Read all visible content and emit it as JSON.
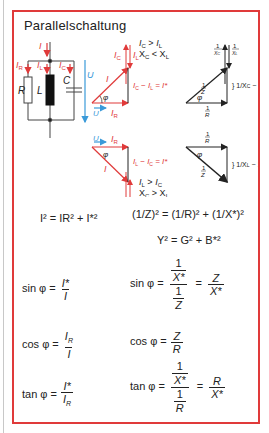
{
  "title": "Parallelschaltung",
  "colors": {
    "border": "#e03a3a",
    "current": "#e03a3a",
    "voltage": "#3a9ad9",
    "ink": "#222222",
    "inductor": "#111111"
  },
  "circuit": {
    "labels": {
      "I": "I",
      "IR": "IR",
      "IL": "IL",
      "IC": "IC",
      "R": "R",
      "L": "L",
      "C": "C",
      "U": "U"
    }
  },
  "phasor_capacitive": {
    "condition_1": "IC > IL",
    "condition_2": "XC < XL",
    "labels": [
      "IC",
      "IL",
      "I",
      "φ",
      "U",
      "IR"
    ],
    "difference": "IC − IL = I*"
  },
  "admittance_capacitive": {
    "labels": [
      "1/XC",
      "1/XL",
      "1/Z",
      "φ",
      "1/R"
    ],
    "difference": "1/XC − 1/XL = 1/X*"
  },
  "phasor_inductive": {
    "condition_1": "IL > IC",
    "condition_2": "XC > XL",
    "labels": [
      "U",
      "IR",
      "φ",
      "I",
      "IL",
      "IC"
    ],
    "difference": "IL − IC = I*"
  },
  "admittance_inductive": {
    "labels": [
      "1/R",
      "φ",
      "1/Z",
      "1/XL",
      "1/XC"
    ],
    "difference": "1/XL − 1/XC = 1/X*"
  },
  "formulas": {
    "current_pythagoras": "I² = IR² + I*²",
    "admittance_pythagoras": "(1/Z)² = (1/R)² + (1/X*)²",
    "admittance_gb": "Y² = G² + B*²",
    "sin_current": "sin φ = I*/I",
    "sin_admittance": "sin φ = (1/X*)/(1/Z) = Z/X*",
    "cos_current": "cos φ = IR/I",
    "cos_admittance": "cos φ = Z/R",
    "tan_current": "tan φ = I*/IR",
    "tan_admittance": "tan φ = (1/X*)/(1/R) = R/X*"
  },
  "text": {
    "sin": "sin φ =",
    "cos": "cos φ =",
    "tan": "tan φ =",
    "eq": "=",
    "one": "1",
    "Z": "Z",
    "R": "R",
    "Xs": "X*",
    "I": "I",
    "Is": "I*",
    "Y2": "Y² = G² + B*²"
  }
}
